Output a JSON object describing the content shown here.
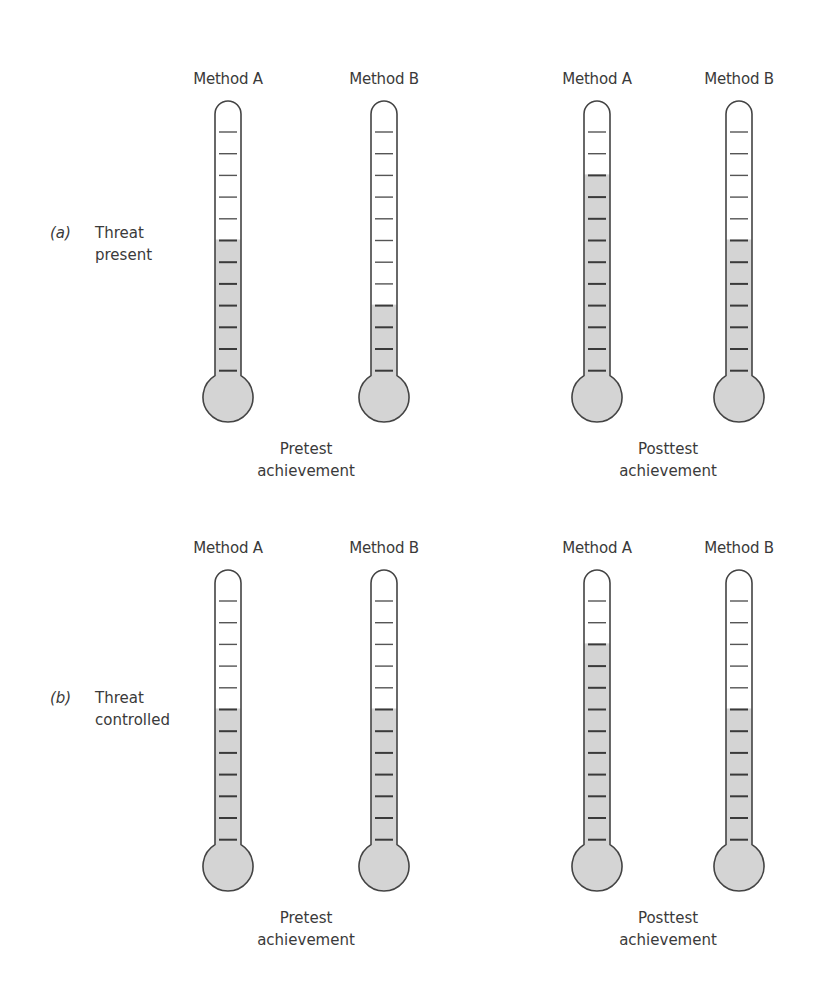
{
  "style": {
    "fill_color": "#d4d4d4",
    "outline_color": "#444444",
    "tick_color": "#555555",
    "text_color": "#3a3a3a"
  },
  "thermometer_geometry": {
    "total_ticks": 12,
    "x_centers": [
      228,
      384,
      597,
      739
    ]
  },
  "panels": [
    {
      "letter": "(a)",
      "title_line1": "Threat",
      "title_line2": "present",
      "columns": [
        "Method A",
        "Method B",
        "Method A",
        "Method B"
      ],
      "pretest_caption_line1": "Pretest",
      "pretest_caption_line2": "achievement",
      "posttest_caption_line1": "Posttest",
      "posttest_caption_line2": "achievement",
      "filled_ticks": [
        7,
        4,
        10,
        7
      ]
    },
    {
      "letter": "(b)",
      "title_line1": "Threat",
      "title_line2": "controlled",
      "columns": [
        "Method A",
        "Method B",
        "Method A",
        "Method B"
      ],
      "pretest_caption_line1": "Pretest",
      "pretest_caption_line2": "achievement",
      "posttest_caption_line1": "Posttest",
      "posttest_caption_line2": "achievement",
      "filled_ticks": [
        7,
        7,
        10,
        7
      ]
    }
  ]
}
